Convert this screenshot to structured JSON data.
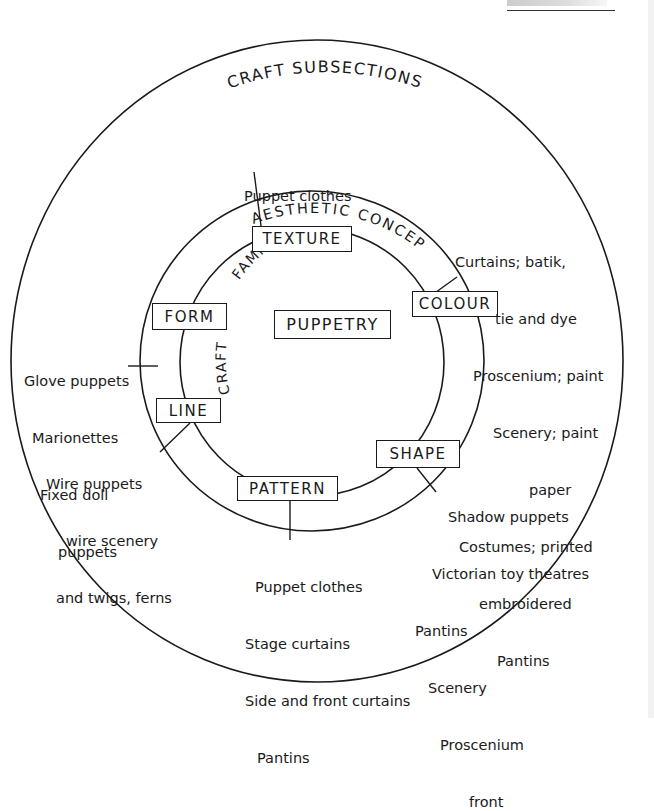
{
  "diagram": {
    "header_fragment": "",
    "outer_ring_label": "CRAFT SUBSECTIONS",
    "middle_ring_label": "AESTHETIC CONCEPT",
    "inner_ring_label_a": "FAMILY",
    "inner_ring_label_b": "CRAFT",
    "center": "PUPPETRY",
    "concepts": [
      {
        "id": "texture",
        "label": "TEXTURE"
      },
      {
        "id": "colour",
        "label": "COLOUR"
      },
      {
        "id": "form",
        "label": "FORM"
      },
      {
        "id": "line",
        "label": "LINE"
      },
      {
        "id": "pattern",
        "label": "PATTERN"
      },
      {
        "id": "shape",
        "label": "SHAPE"
      }
    ],
    "notes": {
      "texture": [
        "Puppet clothes"
      ],
      "colour": [
        "Curtains; batik,",
        "tie and dye",
        "Proscenium; paint",
        "Scenery; paint",
        "paper",
        "Costumes; printed",
        "embroidered",
        "Pantins"
      ],
      "form": [
        "Glove puppets",
        "Marionettes",
        "Fixed doll",
        "puppets"
      ],
      "line": [
        "Wire puppets",
        "wire scenery",
        "and twigs, ferns"
      ],
      "pattern": [
        "Puppet clothes",
        "Stage curtains",
        "Side and front curtains",
        "Pantins"
      ],
      "shape": [
        "Shadow puppets",
        "Victorian toy theatres",
        "Pantins",
        "Scenery",
        "Proscenium",
        "front"
      ]
    },
    "colors": {
      "ink": "#1a1a1a",
      "paper": "#ffffff"
    }
  }
}
